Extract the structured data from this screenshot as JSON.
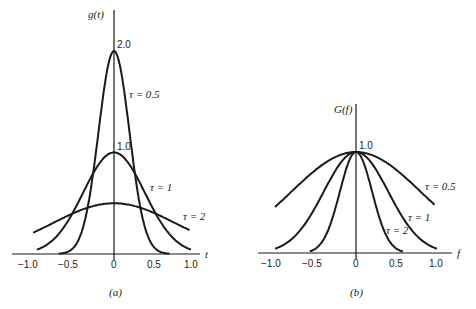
{
  "chart_data": [
    {
      "type": "line",
      "panel": "(a)",
      "title": "",
      "ylabel": "g(t)",
      "xlabel": "t",
      "xticks": [
        "-1.0",
        "-0.5",
        "0",
        "0.5",
        "1.0"
      ],
      "xlim": [
        -1.0,
        1.0
      ],
      "ylim": [
        0,
        2.0
      ],
      "annotations": [
        "2.0",
        "1.0"
      ],
      "formula": "g(t) = (1/tau) * exp(-pi t^2 / tau^2)",
      "series": [
        {
          "name": "τ = 0.5",
          "tau": 0.5,
          "x": [
            -0.75,
            -0.5,
            -0.25,
            0,
            0.25,
            0.5,
            0.75
          ],
          "values": [
            0.002,
            0.087,
            0.911,
            2.0,
            0.911,
            0.087,
            0.002
          ]
        },
        {
          "name": "τ = 1",
          "tau": 1,
          "x": [
            -1.0,
            -0.5,
            0,
            0.5,
            1.0
          ],
          "values": [
            0.043,
            0.456,
            1.0,
            0.456,
            0.043
          ]
        },
        {
          "name": "τ = 2",
          "tau": 2,
          "x": [
            -1.0,
            -0.5,
            0,
            0.5,
            1.0
          ],
          "values": [
            0.228,
            0.411,
            0.5,
            0.411,
            0.228
          ]
        }
      ],
      "grid": false
    },
    {
      "type": "line",
      "panel": "(b)",
      "title": "",
      "ylabel": "G(f)",
      "xlabel": "f",
      "xticks": [
        "-1.0",
        "-0.5",
        "0",
        "0.5",
        "1.0"
      ],
      "xlim": [
        -1.0,
        1.0
      ],
      "ylim": [
        0,
        1.0
      ],
      "annotations": [
        "1.0"
      ],
      "formula": "G(f) = exp(-pi f^2 tau^2)",
      "series": [
        {
          "name": "τ = 0.5",
          "tau": 0.5,
          "x": [
            -1.0,
            -0.5,
            0,
            0.5,
            1.0
          ],
          "values": [
            0.456,
            0.822,
            1.0,
            0.822,
            0.456
          ]
        },
        {
          "name": "τ = 1",
          "tau": 1,
          "x": [
            -1.0,
            -0.5,
            0,
            0.5,
            1.0
          ],
          "values": [
            0.043,
            0.456,
            1.0,
            0.456,
            0.043
          ]
        },
        {
          "name": "τ = 2",
          "tau": 2,
          "x": [
            -0.6,
            -0.5,
            -0.25,
            0,
            0.25,
            0.5,
            0.6
          ],
          "values": [
            0.011,
            0.043,
            0.456,
            1.0,
            0.456,
            0.043,
            0.011
          ]
        }
      ],
      "grid": false
    }
  ],
  "panels": {
    "a": {
      "caption": "(a)",
      "ylabel": "g(t)",
      "xlabel": "t",
      "ticks": [
        "−1.0",
        "−0.5",
        "0",
        "0.5",
        "1.0"
      ],
      "peak_labels": [
        "2.0",
        "1.0"
      ],
      "legend": [
        "τ = 0.5",
        "τ = 1",
        "τ = 2"
      ]
    },
    "b": {
      "caption": "(b)",
      "ylabel": "G(f)",
      "xlabel": "f",
      "ticks": [
        "−1.0",
        "−0.5",
        "0",
        "0.5",
        "1.0"
      ],
      "peak_labels": [
        "1.0"
      ],
      "legend": [
        "τ = 0.5",
        "τ = 1",
        "τ = 2"
      ]
    }
  }
}
